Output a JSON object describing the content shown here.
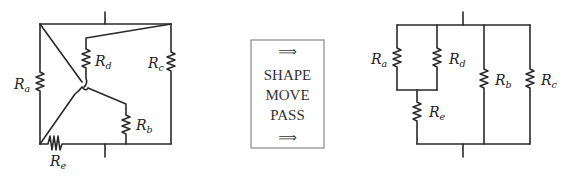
{
  "left_circuit": {
    "labels": {
      "Ra": {
        "main": "R",
        "sub": "a"
      },
      "Rb": {
        "main": "R",
        "sub": "b"
      },
      "Rc": {
        "main": "R",
        "sub": "c"
      },
      "Rd": {
        "main": "R",
        "sub": "d"
      },
      "Re": {
        "main": "R",
        "sub": "e"
      }
    }
  },
  "transform_box": {
    "arrow_top": "⟹",
    "line1": "SHAPE",
    "line2": "MOVE",
    "line3": "PASS",
    "arrow_bottom": "⟹"
  },
  "right_circuit": {
    "labels": {
      "Ra": {
        "main": "R",
        "sub": "a"
      },
      "Rb": {
        "main": "R",
        "sub": "b"
      },
      "Rc": {
        "main": "R",
        "sub": "c"
      },
      "Rd": {
        "main": "R",
        "sub": "d"
      },
      "Re": {
        "main": "R",
        "sub": "e"
      }
    }
  },
  "colors": {
    "wire": "#2a2a2a",
    "text": "#222222",
    "box_border": "#888888"
  }
}
